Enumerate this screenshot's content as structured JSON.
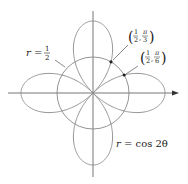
{
  "figure": {
    "type": "polar-graph",
    "curves": [
      {
        "name": "four-leaved rose",
        "equation_lhs": "r = ",
        "equation_rhs": "cos 2θ"
      },
      {
        "name": "circle",
        "equation_lhs": "r = ",
        "num": "1",
        "den": "2"
      }
    ],
    "points": [
      {
        "label_r_num": "1",
        "label_r_den": "2",
        "label_theta_num": "π",
        "label_theta_den": "3"
      },
      {
        "label_r_num": "1",
        "label_r_den": "2",
        "label_theta_num": "π",
        "label_theta_den": "6"
      }
    ],
    "colors": {
      "curve": "#888888",
      "axis": "#555555",
      "text": "#222222",
      "point": "#222222"
    }
  }
}
